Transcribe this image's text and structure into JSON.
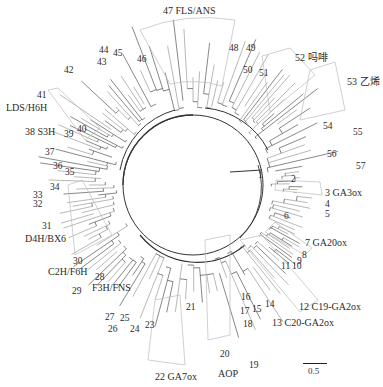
{
  "diagram": {
    "type": "radial-phylogenetic-tree",
    "center": [
      193,
      185
    ],
    "scale_bar": {
      "label": "0.5"
    },
    "clades": [
      {
        "id": 1,
        "label": "1",
        "x": 258,
        "y": 171
      },
      {
        "id": 2,
        "label": "2",
        "x": 291,
        "y": 175
      },
      {
        "id": 3,
        "label": "3 GA3ox",
        "x": 325,
        "y": 188
      },
      {
        "id": 4,
        "label": "4",
        "x": 325,
        "y": 200
      },
      {
        "id": 5,
        "label": "5",
        "x": 325,
        "y": 210
      },
      {
        "id": 6,
        "label": "6",
        "x": 284,
        "y": 212
      },
      {
        "id": 7,
        "label": "7 GA20ox",
        "x": 305,
        "y": 238
      },
      {
        "id": 8,
        "label": "8",
        "x": 302,
        "y": 251
      },
      {
        "id": 9,
        "label": "9",
        "x": 297,
        "y": 257
      },
      {
        "id": 10,
        "label": "10",
        "x": 292,
        "y": 262
      },
      {
        "id": 11,
        "label": "11",
        "x": 281,
        "y": 262
      },
      {
        "id": 12,
        "label": "12 C19-GA2ox",
        "x": 299,
        "y": 302
      },
      {
        "id": 13,
        "label": "13 C20-GA2ox",
        "x": 272,
        "y": 318
      },
      {
        "id": 14,
        "label": "14",
        "x": 265,
        "y": 300
      },
      {
        "id": 15,
        "label": "15",
        "x": 252,
        "y": 305
      },
      {
        "id": 16,
        "label": "16",
        "x": 241,
        "y": 293
      },
      {
        "id": 17,
        "label": "17",
        "x": 240,
        "y": 307
      },
      {
        "id": 18,
        "label": "18",
        "x": 243,
        "y": 320
      },
      {
        "id": 19,
        "label": "19",
        "x": 249,
        "y": 361
      },
      {
        "id": 20,
        "label": "20",
        "x": 220,
        "y": 350
      },
      {
        "id": 21,
        "label": "21",
        "x": 186,
        "y": 303
      },
      {
        "id": 22,
        "label": "22 GA7ox",
        "x": 155,
        "y": 372
      },
      {
        "id": 23,
        "label": "23",
        "x": 145,
        "y": 321
      },
      {
        "id": 24,
        "label": "24",
        "x": 130,
        "y": 325
      },
      {
        "id": 25,
        "label": "25",
        "x": 120,
        "y": 314
      },
      {
        "id": 26,
        "label": "26",
        "x": 108,
        "y": 325
      },
      {
        "id": 27,
        "label": "27",
        "x": 105,
        "y": 313
      },
      {
        "id": 28,
        "label": "28",
        "x": 95,
        "y": 273
      },
      {
        "id": 29,
        "label": "29",
        "x": 72,
        "y": 287
      },
      {
        "id": 30,
        "label": "30",
        "x": 73,
        "y": 257
      },
      {
        "id": 31,
        "label": "31",
        "x": 42,
        "y": 222
      },
      {
        "id": 32,
        "label": "32",
        "x": 33,
        "y": 200
      },
      {
        "id": 33,
        "label": "33",
        "x": 33,
        "y": 191
      },
      {
        "id": 34,
        "label": "34",
        "x": 50,
        "y": 183
      },
      {
        "id": 35,
        "label": "35",
        "x": 65,
        "y": 168
      },
      {
        "id": 36,
        "label": "36",
        "x": 53,
        "y": 162
      },
      {
        "id": 37,
        "label": "37",
        "x": 45,
        "y": 148
      },
      {
        "id": 38,
        "label": "38 S3H",
        "x": 25,
        "y": 127
      },
      {
        "id": 39,
        "label": "39",
        "x": 64,
        "y": 130
      },
      {
        "id": 40,
        "label": "40",
        "x": 77,
        "y": 125
      },
      {
        "id": 41,
        "label": "41",
        "x": 37,
        "y": 91
      },
      {
        "id": 42,
        "label": "42",
        "x": 64,
        "y": 66
      },
      {
        "id": 43,
        "label": "43",
        "x": 97,
        "y": 58
      },
      {
        "id": 44,
        "label": "44",
        "x": 99,
        "y": 46
      },
      {
        "id": 45,
        "label": "45",
        "x": 113,
        "y": 49
      },
      {
        "id": 46,
        "label": "46",
        "x": 137,
        "y": 55
      },
      {
        "id": 47,
        "label": "47 FLS/ANS",
        "x": 163,
        "y": 6
      },
      {
        "id": 48,
        "label": "48",
        "x": 229,
        "y": 44
      },
      {
        "id": 49,
        "label": "49",
        "x": 246,
        "y": 44
      },
      {
        "id": 50,
        "label": "50",
        "x": 243,
        "y": 66
      },
      {
        "id": 51,
        "label": "51",
        "x": 259,
        "y": 69
      },
      {
        "id": 52,
        "label": "52 吗啡",
        "x": 295,
        "y": 53
      },
      {
        "id": 53,
        "label": "53 乙烯",
        "x": 347,
        "y": 77
      },
      {
        "id": 54,
        "label": "54",
        "x": 323,
        "y": 122
      },
      {
        "id": 55,
        "label": "55",
        "x": 353,
        "y": 128
      },
      {
        "id": 56,
        "label": "56",
        "x": 327,
        "y": 150
      },
      {
        "id": 57,
        "label": "57",
        "x": 356,
        "y": 162
      }
    ],
    "group_labels": [
      {
        "label": "LDS/H6H",
        "x": 6,
        "y": 103
      },
      {
        "label": "D4H/BX6",
        "x": 25,
        "y": 234
      },
      {
        "label": "C2H/F6H",
        "x": 48,
        "y": 267
      },
      {
        "label": "F3H/FNS",
        "x": 92,
        "y": 283
      },
      {
        "label": "AOP",
        "x": 218,
        "y": 369
      }
    ]
  }
}
